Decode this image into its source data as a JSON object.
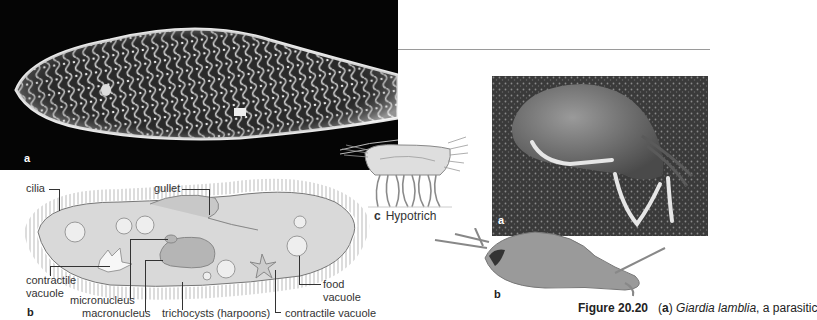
{
  "figure": {
    "number": "Figure 20.20",
    "caption_panel": "a",
    "caption_italic": "Giardia lamblia",
    "caption_rest": ", a parasitic"
  },
  "panels": {
    "paramecium_photo": {
      "letter": "a"
    },
    "paramecium_diagram": {
      "letter": "b",
      "labels": {
        "cilia": "cilia",
        "gullet": "gullet",
        "contractile_vacuole_left_1": "contractile",
        "contractile_vacuole_left_2": "vacuole",
        "micronucleus": "micronucleus",
        "macronucleus": "macronucleus",
        "trichocysts": "trichocysts (harpoons)",
        "contractile_vacuole_right": "contractile vacuole",
        "food_vacuole_1": "food",
        "food_vacuole_2": "vacuole"
      }
    },
    "hypotrich": {
      "letter": "c",
      "label": "Hypotrich"
    },
    "giardia_photo": {
      "letter": "a"
    },
    "giardia_drawing": {
      "letter": "b"
    }
  },
  "colors": {
    "photo_bg": "#050505",
    "rule": "#9a9a9a",
    "diagram_body": "#d8d8d8",
    "text": "#222222"
  }
}
